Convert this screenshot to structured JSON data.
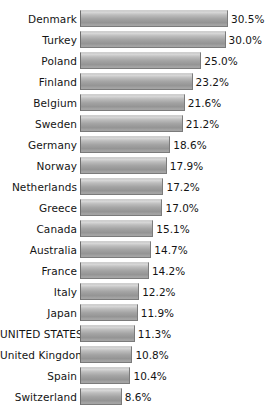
{
  "chart_data": {
    "type": "bar",
    "orientation": "horizontal",
    "title": "",
    "subtitle": "",
    "xlabel": "",
    "ylabel": "",
    "grid": false,
    "legend": null,
    "value_suffix": "%",
    "xlim": [
      0,
      30.5
    ],
    "highlighted_category": "UNITED STATES",
    "categories": [
      "Denmark",
      "Turkey",
      "Poland",
      "Finland",
      "Belgium",
      "Sweden",
      "Germany",
      "Norway",
      "Netherlands",
      "Greece",
      "Canada",
      "Australia",
      "France",
      "Italy",
      "Japan",
      "UNITED STATES",
      "United Kingdom",
      "Spain",
      "Switzerland"
    ],
    "values": [
      30.5,
      30.0,
      25.0,
      23.2,
      21.6,
      21.2,
      18.6,
      17.9,
      17.2,
      17.0,
      15.1,
      14.7,
      14.2,
      12.2,
      11.9,
      11.3,
      10.8,
      10.4,
      8.6
    ],
    "value_labels": [
      "30.5%",
      "30.0%",
      "25.0%",
      "23.2%",
      "21.6%",
      "21.2%",
      "18.6%",
      "17.9%",
      "17.2%",
      "17.0%",
      "15.1%",
      "14.7%",
      "14.2%",
      "12.2%",
      "11.9%",
      "11.3%",
      "10.8%",
      "10.4%",
      "8.6%"
    ],
    "bar_color": "#a3a3a3",
    "background_color": "#ffffff",
    "text_color": "#141414"
  }
}
